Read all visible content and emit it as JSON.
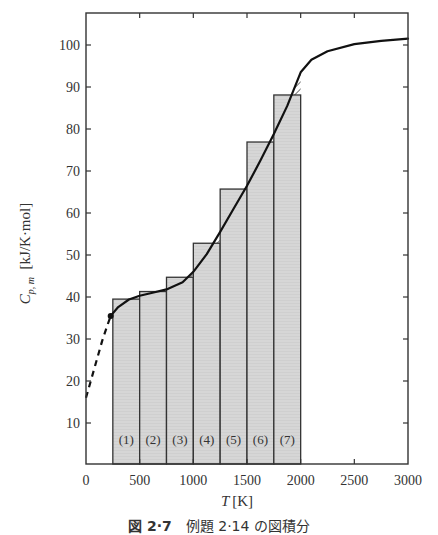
{
  "chart_data": {
    "type": "bar",
    "subtype": "rectangle-integration-with-curve",
    "title": "",
    "caption": {
      "figure_number": "図 2·7",
      "text": "例題 2·14 の図積分"
    },
    "xlabel": "T [K]",
    "xlabel_var": "T",
    "xlabel_unit": "[K]",
    "ylabel": "C_p,m [kJ/K·mol]",
    "ylabel_var": "C",
    "ylabel_sub": "p, m",
    "ylabel_unit": "[kJ/K·mol]",
    "xlim": [
      0,
      3000
    ],
    "ylim": [
      0,
      107
    ],
    "xticks": [
      0,
      500,
      1000,
      1500,
      2000,
      2500,
      3000
    ],
    "yticks": [
      10,
      20,
      30,
      40,
      50,
      60,
      70,
      80,
      90,
      100
    ],
    "grid": false,
    "legend": null,
    "bars": {
      "labels": [
        "(1)",
        "(2)",
        "(3)",
        "(4)",
        "(5)",
        "(6)",
        "(7)"
      ],
      "x_start": [
        250,
        500,
        750,
        1000,
        1250,
        1500,
        1750
      ],
      "x_end": [
        500,
        750,
        1000,
        1250,
        1500,
        1750,
        2000
      ],
      "heights": [
        39.5,
        41.3,
        44.7,
        52.8,
        65.7,
        76.9,
        88.1
      ],
      "fill": "#d6d6d6",
      "hatch_note": "hatched triangles mark curve-vs-bar-top differences"
    },
    "curve": {
      "name": "C_p,m(T)",
      "solid": {
        "x": [
          230,
          300,
          400,
          500,
          600,
          750,
          900,
          1000,
          1125,
          1250,
          1375,
          1500,
          1625,
          1750,
          1875,
          2000,
          2100,
          2250,
          2500,
          2750,
          3000
        ],
        "y": [
          35.5,
          37.6,
          39.4,
          40.3,
          40.9,
          41.8,
          43.5,
          46.0,
          50.2,
          55.5,
          61.0,
          66.5,
          72.5,
          78.8,
          85.5,
          93.5,
          96.5,
          98.5,
          100.2,
          101.0,
          101.5
        ]
      },
      "dashed": {
        "x": [
          0,
          50,
          100,
          150,
          200,
          230
        ],
        "y": [
          16,
          20.5,
          25,
          29.5,
          33.3,
          35.5
        ]
      },
      "marker": {
        "x": 230,
        "y": 35.5
      }
    }
  }
}
